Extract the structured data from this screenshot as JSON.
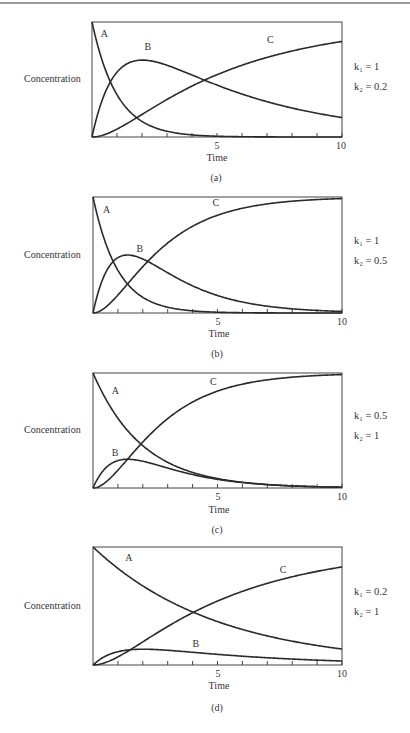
{
  "chart_data": [
    {
      "type": "line",
      "panel": "(a)",
      "title": "",
      "xlabel": "Time",
      "ylabel": "Concentration",
      "xlim": [
        0,
        10
      ],
      "ylim": [
        0,
        1
      ],
      "x_ticks": [
        1,
        2,
        3,
        4,
        5,
        6,
        7,
        8,
        9,
        10
      ],
      "x_tick_labels": {
        "5": "5",
        "10": "10"
      },
      "grid": false,
      "params": {
        "k1": 1,
        "k2": 0.2
      },
      "params_text": {
        "k1": "k₁ = 1",
        "k2": "k₂ = 0.2"
      },
      "series": [
        {
          "name": "A",
          "label_pos": [
            0.35,
            0.87
          ],
          "values_at_t": {
            "0": 1.0,
            "1": 0.37,
            "2": 0.14,
            "3": 0.05,
            "5": 0.01,
            "10": 0.0
          }
        },
        {
          "name": "B",
          "label_pos": [
            2.1,
            0.76
          ],
          "values_at_t": {
            "0": 0.0,
            "1": 0.56,
            "2": 0.67,
            "3": 0.62,
            "5": 0.46,
            "10": 0.17
          }
        },
        {
          "name": "C",
          "label_pos": [
            7.0,
            0.82
          ],
          "values_at_t": {
            "0": 0.0,
            "1": 0.07,
            "2": 0.19,
            "3": 0.33,
            "5": 0.53,
            "10": 0.83
          }
        }
      ]
    },
    {
      "type": "line",
      "panel": "(b)",
      "xlabel": "Time",
      "ylabel": "Concentration",
      "xlim": [
        0,
        10
      ],
      "ylim": [
        0,
        1
      ],
      "x_ticks": [
        1,
        2,
        3,
        4,
        5,
        6,
        7,
        8,
        9,
        10
      ],
      "x_tick_labels": {
        "5": "5",
        "10": "10"
      },
      "grid": false,
      "params": {
        "k1": 1,
        "k2": 0.5
      },
      "params_text": {
        "k1": "k₁ = 1",
        "k2": "k₂ = 0.5"
      },
      "series": [
        {
          "name": "A",
          "label_pos": [
            0.4,
            0.86
          ],
          "values_at_t": {
            "0": 1.0,
            "1": 0.37,
            "2": 0.14,
            "5": 0.01,
            "10": 0.0
          }
        },
        {
          "name": "B",
          "label_pos": [
            1.75,
            0.53
          ],
          "values_at_t": {
            "0": 0.0,
            "1": 0.47,
            "1.39": 0.5,
            "2": 0.46,
            "5": 0.15,
            "10": 0.01
          }
        },
        {
          "name": "C",
          "label_pos": [
            4.8,
            0.92
          ],
          "values_at_t": {
            "0": 0.0,
            "1": 0.16,
            "2": 0.4,
            "5": 0.84,
            "10": 0.99
          }
        }
      ]
    },
    {
      "type": "line",
      "panel": "(c)",
      "xlabel": "Time",
      "ylabel": "Concentration",
      "xlim": [
        0,
        10
      ],
      "ylim": [
        0,
        1
      ],
      "x_ticks": [
        1,
        2,
        3,
        4,
        5,
        6,
        7,
        8,
        9,
        10
      ],
      "x_tick_labels": {
        "5": "5",
        "10": "10"
      },
      "grid": false,
      "params": {
        "k1": 0.5,
        "k2": 1
      },
      "params_text": {
        "k1": "k₁ = 0.5",
        "k2": "k₂ = 1"
      },
      "series": [
        {
          "name": "A",
          "label_pos": [
            0.75,
            0.82
          ],
          "values_at_t": {
            "0": 1.0,
            "1": 0.61,
            "2": 0.37,
            "5": 0.08,
            "10": 0.01
          }
        },
        {
          "name": "B",
          "label_pos": [
            0.75,
            0.28
          ],
          "values_at_t": {
            "0": 0.0,
            "1": 0.24,
            "1.39": 0.25,
            "2": 0.23,
            "5": 0.08,
            "10": 0.01
          }
        },
        {
          "name": "C",
          "label_pos": [
            4.7,
            0.9
          ],
          "values_at_t": {
            "0": 0.0,
            "1": 0.15,
            "2": 0.4,
            "5": 0.84,
            "10": 0.99
          }
        }
      ]
    },
    {
      "type": "line",
      "panel": "(d)",
      "xlabel": "Time",
      "ylabel": "Concentration",
      "xlim": [
        0,
        10
      ],
      "ylim": [
        0,
        1
      ],
      "x_ticks": [
        1,
        2,
        3,
        4,
        5,
        6,
        7,
        8,
        9,
        10
      ],
      "x_tick_labels": {
        "5": "5",
        "10": "10"
      },
      "grid": false,
      "params": {
        "k1": 0.2,
        "k2": 1
      },
      "params_text": {
        "k1": "k₁ = 0.2",
        "k2": "k₂ = 1"
      },
      "series": [
        {
          "name": "A",
          "label_pos": [
            1.3,
            0.88
          ],
          "values_at_t": {
            "0": 1.0,
            "2": 0.67,
            "4": 0.45,
            "5": 0.37,
            "10": 0.14
          }
        },
        {
          "name": "B",
          "label_pos": [
            4.0,
            0.15
          ],
          "values_at_t": {
            "0": 0.0,
            "1": 0.15,
            "2": 0.16,
            "5": 0.09,
            "10": 0.03
          }
        },
        {
          "name": "C",
          "label_pos": [
            7.5,
            0.78
          ],
          "values_at_t": {
            "0": 0.0,
            "2": 0.17,
            "4": 0.45,
            "5": 0.54,
            "10": 0.83
          }
        }
      ]
    }
  ],
  "panels": [
    {
      "caption": "(a)",
      "ylabel": "Concentration",
      "xlabel": "Time",
      "tick5": "5",
      "tick10": "10",
      "k1_text": "k₁ = 1",
      "k2_text": "k₂ = 0.2"
    },
    {
      "caption": "(b)",
      "ylabel": "Concentration",
      "xlabel": "Time",
      "tick5": "5",
      "tick10": "10",
      "k1_text": "k₁ = 1",
      "k2_text": "k₂ = 0.5"
    },
    {
      "caption": "(c)",
      "ylabel": "Concentration",
      "xlabel": "Time",
      "tick5": "5",
      "tick10": "10",
      "k1_text": "k₁ = 0.5",
      "k2_text": "k₂ = 1"
    },
    {
      "caption": "(d)",
      "ylabel": "Concentration",
      "xlabel": "Time",
      "tick5": "5",
      "tick10": "10",
      "k1_text": "k₁ = 0.2",
      "k2_text": "k₂ = 1"
    }
  ]
}
